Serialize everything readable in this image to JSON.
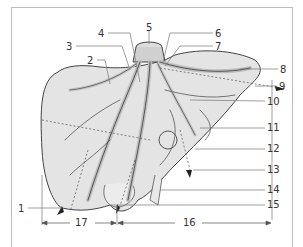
{
  "figure": {
    "colors": {
      "organ_fill": "#e4e4e4",
      "outline": "#444444",
      "vessel_fill": "#c8c8c8",
      "frame": "#b8bcc8",
      "label": "#333333"
    }
  },
  "labels": [
    {
      "id": "1",
      "text": "1",
      "x": 18,
      "y": 204
    },
    {
      "id": "2",
      "text": "2",
      "x": 87,
      "y": 56
    },
    {
      "id": "3",
      "text": "3",
      "x": 66,
      "y": 42
    },
    {
      "id": "4",
      "text": "4",
      "x": 98,
      "y": 29
    },
    {
      "id": "5",
      "text": "5",
      "x": 146,
      "y": 23
    },
    {
      "id": "6",
      "text": "6",
      "x": 215,
      "y": 29
    },
    {
      "id": "7",
      "text": "7",
      "x": 215,
      "y": 42
    },
    {
      "id": "8",
      "text": "8",
      "x": 280,
      "y": 65
    },
    {
      "id": "9",
      "text": "9",
      "x": 279,
      "y": 82
    },
    {
      "id": "10",
      "text": "10",
      "x": 267,
      "y": 97
    },
    {
      "id": "11",
      "text": "11",
      "x": 267,
      "y": 123
    },
    {
      "id": "12",
      "text": "12",
      "x": 267,
      "y": 144
    },
    {
      "id": "13",
      "text": "13",
      "x": 267,
      "y": 165
    },
    {
      "id": "14",
      "text": "14",
      "x": 267,
      "y": 185
    },
    {
      "id": "15",
      "text": "15",
      "x": 267,
      "y": 200
    },
    {
      "id": "16",
      "text": "16",
      "x": 183,
      "y": 218
    },
    {
      "id": "17",
      "text": "17",
      "x": 75,
      "y": 218
    }
  ]
}
